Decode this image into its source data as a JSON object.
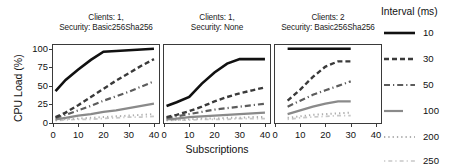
{
  "figure": {
    "xlabel": "Subscriptions",
    "ylabel": "CPU Load (%)",
    "ytick_labels": [
      "0",
      "25",
      "50",
      "75",
      "100"
    ],
    "xtick_labels": [
      "0",
      "10",
      "20",
      "30",
      "40"
    ]
  },
  "legend": {
    "title": "Interval (ms)",
    "entries": [
      {
        "label": "10",
        "style": "solid-thick",
        "color": "#111111"
      },
      {
        "label": "30",
        "style": "dashed",
        "color": "#3a3a3a"
      },
      {
        "label": "50",
        "style": "dashdot",
        "color": "#5c5c5c"
      },
      {
        "label": "100",
        "style": "solid-short",
        "color": "#8a8a8a"
      },
      {
        "label": "200",
        "style": "dotted",
        "color": "#aeaeae"
      },
      {
        "label": "250",
        "style": "dashdot-faint",
        "color": "#c8c8c8"
      }
    ]
  },
  "panels": [
    {
      "title_line1": "Clients: 1,",
      "title_line2": "Security: Basic256Sha256"
    },
    {
      "title_line1": "Clients: 1,",
      "title_line2": "Security: None"
    },
    {
      "title_line1": "Clients: 2",
      "title_line2": "Security: Basic256Sha256"
    }
  ],
  "chart_data": {
    "type": "line",
    "title": "",
    "xlabel": "Subscriptions",
    "ylabel": "CPU Load (%)",
    "xlim": [
      0,
      42
    ],
    "ylim": [
      0,
      105
    ],
    "xticks": [
      0,
      10,
      20,
      30,
      40
    ],
    "yticks": [
      0,
      25,
      50,
      75,
      100
    ],
    "grid": false,
    "legend_title": "Interval (ms)",
    "legend_position": "right",
    "facets": [
      {
        "name": "Clients: 1, Security: Basic256Sha256",
        "series": [
          {
            "name": "10",
            "x": [
              1,
              5,
              10,
              15,
              20,
              25,
              30,
              35,
              40
            ],
            "y": [
              43,
              58,
              72,
              85,
              96,
              97,
              98,
              99,
              100
            ]
          },
          {
            "name": "30",
            "x": [
              1,
              5,
              10,
              15,
              20,
              25,
              30,
              35,
              40
            ],
            "y": [
              8,
              14,
              24,
              35,
              46,
              57,
              67,
              77,
              86
            ]
          },
          {
            "name": "50",
            "x": [
              1,
              5,
              10,
              15,
              20,
              25,
              30,
              35,
              40
            ],
            "y": [
              7,
              11,
              17,
              23,
              30,
              36,
              42,
              49,
              56
            ]
          },
          {
            "name": "100",
            "x": [
              1,
              5,
              10,
              15,
              20,
              25,
              30,
              35,
              40
            ],
            "y": [
              5,
              7,
              10,
              12,
              15,
              17,
              20,
              23,
              26
            ]
          },
          {
            "name": "200",
            "x": [
              1,
              5,
              10,
              15,
              20,
              25,
              30,
              35,
              40
            ],
            "y": [
              4,
              5,
              6,
              7,
              8,
              9,
              10,
              11,
              12
            ]
          },
          {
            "name": "250",
            "x": [
              1,
              5,
              10,
              15,
              20,
              25,
              30,
              35,
              40
            ],
            "y": [
              3,
              4,
              5,
              5,
              6,
              7,
              8,
              8,
              9
            ]
          }
        ]
      },
      {
        "name": "Clients: 1, Security: None",
        "series": [
          {
            "name": "10",
            "x": [
              1,
              5,
              10,
              15,
              20,
              25,
              30,
              35,
              40
            ],
            "y": [
              23,
              28,
              35,
              53,
              68,
              80,
              86,
              86,
              86
            ]
          },
          {
            "name": "30",
            "x": [
              1,
              5,
              10,
              15,
              20,
              25,
              30,
              35,
              40
            ],
            "y": [
              8,
              11,
              16,
              22,
              29,
              35,
              40,
              44,
              48
            ]
          },
          {
            "name": "50",
            "x": [
              1,
              5,
              10,
              15,
              20,
              25,
              30,
              35,
              40
            ],
            "y": [
              7,
              9,
              12,
              15,
              18,
              20,
              22,
              24,
              26
            ]
          },
          {
            "name": "100",
            "x": [
              1,
              5,
              10,
              15,
              20,
              25,
              30,
              35,
              40
            ],
            "y": [
              5,
              6,
              8,
              9,
              10,
              11,
              12,
              13,
              14
            ]
          },
          {
            "name": "200",
            "x": [
              1,
              5,
              10,
              15,
              20,
              25,
              30,
              35,
              40
            ],
            "y": [
              4,
              4,
              5,
              6,
              6,
              7,
              7,
              8,
              8
            ]
          },
          {
            "name": "250",
            "x": [
              1,
              5,
              10,
              15,
              20,
              25,
              30,
              35,
              40
            ],
            "y": [
              3,
              4,
              4,
              5,
              5,
              5,
              6,
              6,
              6
            ]
          }
        ]
      },
      {
        "name": "Clients: 2, Security: Basic256Sha256",
        "series": [
          {
            "name": "10",
            "x": [
              5,
              10,
              15,
              20,
              25,
              30
            ],
            "y": [
              100,
              100,
              100,
              100,
              100,
              100
            ]
          },
          {
            "name": "30",
            "x": [
              5,
              10,
              15,
              20,
              25,
              30
            ],
            "y": [
              30,
              45,
              62,
              76,
              83,
              83
            ]
          },
          {
            "name": "50",
            "x": [
              5,
              10,
              15,
              20,
              25,
              30
            ],
            "y": [
              22,
              30,
              38,
              44,
              50,
              56
            ]
          },
          {
            "name": "100",
            "x": [
              5,
              10,
              15,
              20,
              25,
              30
            ],
            "y": [
              12,
              17,
              22,
              26,
              29,
              29
            ]
          },
          {
            "name": "200",
            "x": [
              5,
              10,
              15,
              20,
              25,
              30
            ],
            "y": [
              7,
              9,
              11,
              12,
              13,
              14
            ]
          },
          {
            "name": "250",
            "x": [
              5,
              10,
              15,
              20,
              25,
              30
            ],
            "y": [
              5,
              7,
              8,
              9,
              10,
              10
            ]
          }
        ]
      }
    ]
  }
}
